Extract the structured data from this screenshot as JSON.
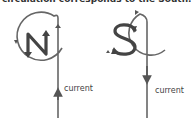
{
  "caption": "circulation corresponds to the South.",
  "diagrams": [
    {
      "pole": "N",
      "current_label": "current",
      "current_direction": "up",
      "circulation": "counterclockwise"
    },
    {
      "pole": "S",
      "current_label": "current",
      "current_direction": "down",
      "circulation": "clockwise"
    }
  ],
  "colors": {
    "line": "#555555",
    "text": "#333333"
  }
}
